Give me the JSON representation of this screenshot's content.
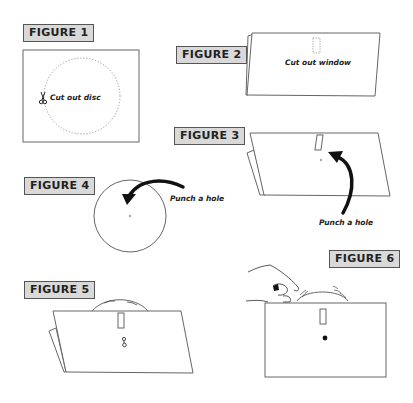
{
  "figures": [
    {
      "id": 1,
      "label": "FIGURE 1",
      "caption": "Cut out disc",
      "icon": "scissors-icon"
    },
    {
      "id": 2,
      "label": "FIGURE 2",
      "caption": "Cut out window"
    },
    {
      "id": 3,
      "label": "FIGURE 3",
      "caption": "Punch a hole",
      "icon": "curved-arrow-icon"
    },
    {
      "id": 4,
      "label": "FIGURE 4",
      "caption": "Punch a hole",
      "icon": "curved-arrow-icon"
    },
    {
      "id": 5,
      "label": "FIGURE 5",
      "icon": "paper-fastener-icon"
    },
    {
      "id": 6,
      "label": "FIGURE 6",
      "icon": "hand-icon"
    }
  ],
  "colors": {
    "label_bg": "#d9d9d9",
    "label_border": "#555555",
    "line": "#555555",
    "dotted": "#999999",
    "arrow": "#111111"
  }
}
